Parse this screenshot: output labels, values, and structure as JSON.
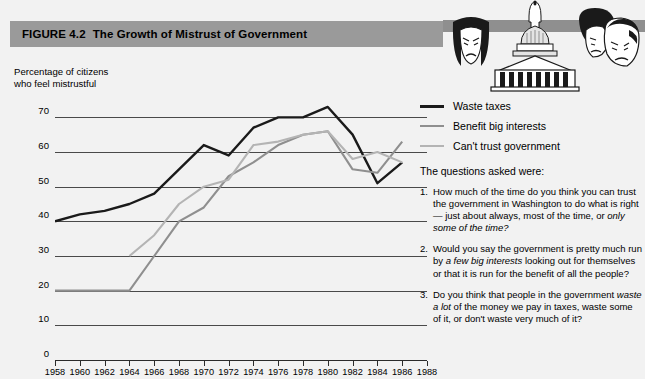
{
  "figure": {
    "number": "FIGURE 4.2",
    "title": "The Growth of Mistrust of Government"
  },
  "artwork": {
    "name": "capitol-and-frowning-faces-illustration",
    "elements": [
      "capitol-dome-building",
      "woman-face",
      "man-face-dark-hair",
      "man-face-light-hair"
    ]
  },
  "chart_data": {
    "type": "line",
    "title": "The Growth of Mistrust of Government",
    "xlabel": "",
    "ylabel": "Percentage of citizens who feel mistrustful",
    "ylabel_line1": "Percentage of citizens",
    "ylabel_line2": "who feel mistrustful",
    "x": [
      1958,
      1960,
      1962,
      1964,
      1966,
      1968,
      1970,
      1972,
      1974,
      1976,
      1978,
      1980,
      1982,
      1984,
      1986,
      1988
    ],
    "xlim": [
      1958,
      1988
    ],
    "ylim": [
      0,
      75
    ],
    "yticks": [
      0,
      10,
      20,
      30,
      40,
      50,
      60,
      70
    ],
    "xticks": [
      1958,
      1960,
      1962,
      1964,
      1966,
      1968,
      1970,
      1972,
      1974,
      1976,
      1978,
      1980,
      1982,
      1984,
      1986,
      1988
    ],
    "grid": true,
    "grid_axis": "y",
    "legend_position": "right",
    "series": [
      {
        "name": "Waste taxes",
        "color": "#1a1a1a",
        "x": [
          1958,
          1960,
          1962,
          1964,
          1966,
          1968,
          1970,
          1972,
          1974,
          1976,
          1978,
          1980,
          1982,
          1984,
          1986,
          1988
        ],
        "values": [
          40,
          42,
          43,
          45,
          48,
          55,
          62,
          59,
          67,
          70,
          70,
          73,
          65,
          51,
          57,
          null
        ],
        "start_year": 1958
      },
      {
        "name": "Benefit big interests",
        "color": "#8f8f8f",
        "x": [
          1958,
          1960,
          1962,
          1964,
          1966,
          1968,
          1970,
          1972,
          1974,
          1976,
          1978,
          1980,
          1982,
          1984,
          1986,
          1988
        ],
        "values": [
          20,
          20,
          20,
          20,
          30,
          40,
          44,
          53,
          57,
          62,
          65,
          66,
          55,
          54,
          63,
          null
        ],
        "start_year": 1958
      },
      {
        "name": "Can't trust government",
        "color": "#b4b4b4",
        "x": [
          1958,
          1960,
          1962,
          1964,
          1966,
          1968,
          1970,
          1972,
          1974,
          1976,
          1978,
          1980,
          1982,
          1984,
          1986,
          1988
        ],
        "values": [
          null,
          null,
          null,
          30,
          36,
          45,
          50,
          52,
          62,
          63,
          65,
          66,
          58,
          60,
          57,
          null
        ],
        "start_year": 1964
      }
    ]
  },
  "legend": {
    "items": [
      {
        "label": "Waste taxes",
        "color": "#1a1a1a",
        "width": "3px"
      },
      {
        "label": "Benefit big interests",
        "color": "#8f8f8f",
        "width": "2.5px"
      },
      {
        "label": "Can't trust government",
        "color": "#b4b4b4",
        "width": "2.5px"
      }
    ]
  },
  "questions": {
    "heading": "The questions asked were:",
    "items": [
      {
        "number": "1.",
        "parts": [
          {
            "text": "How much of the time do you think you can trust the government in Washington to do what is right — just about always, most of the time, or ",
            "italic": false
          },
          {
            "text": "only some of the time?",
            "italic": true
          }
        ]
      },
      {
        "number": "2.",
        "parts": [
          {
            "text": "Would you say the government is pretty much run by ",
            "italic": false
          },
          {
            "text": "a few big interests",
            "italic": true
          },
          {
            "text": " looking out for themselves or that it is run for the benefit of all the people?",
            "italic": false
          }
        ]
      },
      {
        "number": "3.",
        "parts": [
          {
            "text": "Do you think that people in the government ",
            "italic": false
          },
          {
            "text": "waste a lot",
            "italic": true
          },
          {
            "text": " of the money we pay in taxes, waste some of it, or don't waste very much of it?",
            "italic": false
          }
        ]
      }
    ]
  },
  "colors": {
    "background": "#f2f2f2",
    "title_bar": "#9a9a9a",
    "gridline": "#4a4a4a",
    "axis": "#2b2b2b"
  }
}
